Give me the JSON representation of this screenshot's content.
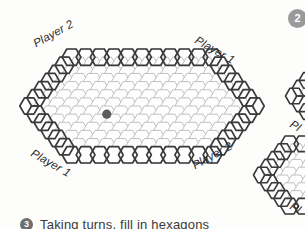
{
  "page": {
    "background_color": "#fdfdfc",
    "top_cut_text": "",
    "step_badge": {
      "label": "2",
      "color": "#9a9a9a"
    }
  },
  "board": {
    "name": "hex-game-board",
    "orientation": "flat-top",
    "rows": 13,
    "middle_row_cells": 17,
    "cell_fill": "#fefefe",
    "cell_stroke": "#b9b9b9",
    "border_stroke": "#3a3a3a",
    "labels": {
      "top_left": "Player 2",
      "top_right": "Player 1",
      "bottom_left": "Player 1",
      "bottom_right": "Player 2"
    },
    "stone": {
      "name": "placed-stone",
      "color": "#5c5c5c",
      "row": 7,
      "col": 5
    }
  },
  "side_figure": {
    "name": "adjacent-board-fragment",
    "label_top": "Pl",
    "label_bottom": "Pl"
  },
  "caption": {
    "bullet": "3",
    "text": "Taking turns, fill in hexagons"
  }
}
